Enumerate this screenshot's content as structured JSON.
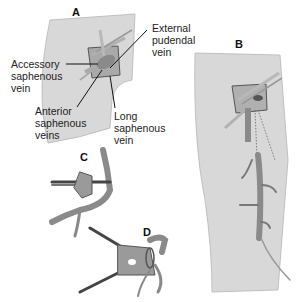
{
  "panels": {
    "A": {
      "letter": "A",
      "labels": {
        "accessory_l1": "Accessory",
        "accessory_l2": "saphenous",
        "accessory_l3": "vein",
        "external_l1": "External",
        "external_l2": "pudendal",
        "external_l3": "vein",
        "anterior_l1": "Anterior",
        "anterior_l2": "saphenous",
        "anterior_l3": "veins",
        "long_l1": "Long",
        "long_l2": "saphenous",
        "long_l3": "vein"
      }
    },
    "B": {
      "letter": "B"
    },
    "C": {
      "letter": "C"
    },
    "D": {
      "letter": "D"
    }
  },
  "colors": {
    "skin": "#d8d8d8",
    "vein": "#8a8a8a",
    "vein_dark": "#6a6a6a",
    "outline": "#555555",
    "leader": "#111111"
  }
}
